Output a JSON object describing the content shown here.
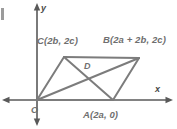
{
  "figure": {
    "type": "coordinate-geometry-diagram",
    "colors": {
      "stroke": "#7c7c7c",
      "axis": "#555555",
      "label": "#6f6f6f",
      "background": "#ffffff"
    },
    "axes": {
      "x_label": "x",
      "y_label": "y",
      "origin_label": "O",
      "x_axis": {
        "y_px": 100,
        "x_start_px": 2,
        "x_end_px": 173,
        "arrows": "both"
      },
      "y_axis": {
        "x_px": 37,
        "y_start_px": 3,
        "y_end_px": 126,
        "arrows": "both"
      }
    },
    "points": [
      {
        "name": "O",
        "label": "O",
        "coords": "(0, 0)",
        "x_px": 37,
        "y_px": 100
      },
      {
        "name": "A",
        "label": "A(2a, 0)",
        "coords": "(2a, 0)",
        "x_px": 113,
        "y_px": 100
      },
      {
        "name": "B",
        "label": "B(2a + 2b, 2c)",
        "coords": "(2a + 2b, 2c)",
        "x_px": 139,
        "y_px": 58
      },
      {
        "name": "C",
        "label": "C(2b, 2c)",
        "coords": "(2b, 2c)",
        "x_px": 64,
        "y_px": 57
      },
      {
        "name": "D",
        "label": "D",
        "coords": "",
        "x_px": 88,
        "y_px": 74
      }
    ],
    "segments": [
      {
        "name": "OA",
        "from": "O",
        "to": "A"
      },
      {
        "name": "AB",
        "from": "A",
        "to": "B"
      },
      {
        "name": "BC",
        "from": "B",
        "to": "C"
      },
      {
        "name": "CO",
        "from": "C",
        "to": "O"
      },
      {
        "name": "OB-diagonal",
        "from": "O",
        "to": "B"
      },
      {
        "name": "AC-diagonal",
        "from": "A",
        "to": "C"
      }
    ]
  }
}
